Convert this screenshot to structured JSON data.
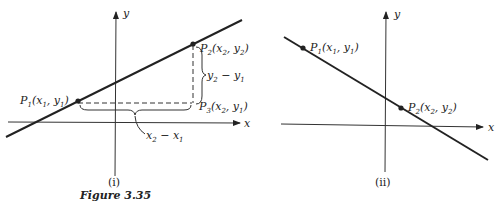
{
  "figure": {
    "caption": "Figure 3.35",
    "panels": [
      {
        "id": "i",
        "label": "(i)",
        "axes": {
          "x_label": "x",
          "y_label": "y"
        },
        "line_slope": "positive",
        "points": [
          {
            "name": "P",
            "sub": "1",
            "coord": "(x",
            "c1": "1",
            "mid": ", y",
            "c2": "1",
            "end": ")"
          },
          {
            "name": "P",
            "sub": "2",
            "coord": "(x",
            "c1": "2",
            "mid": ", y",
            "c2": "2",
            "end": ")"
          },
          {
            "name": "P",
            "sub": "3",
            "coord": "(x",
            "c1": "2",
            "mid": ", y",
            "c2": "1",
            "end": ")"
          }
        ],
        "rise_label": {
          "a": "y",
          "a_sub": "2",
          "op": " − y",
          "b_sub": "1"
        },
        "run_label": {
          "a": "x",
          "a_sub": "2",
          "op": " − x",
          "b_sub": "1"
        }
      },
      {
        "id": "ii",
        "label": "(ii)",
        "axes": {
          "x_label": "x",
          "y_label": "y"
        },
        "line_slope": "negative",
        "points": [
          {
            "name": "P",
            "sub": "1",
            "coord": "(x",
            "c1": "1",
            "mid": ", y",
            "c2": "1",
            "end": ")"
          },
          {
            "name": "P",
            "sub": "2",
            "coord": "(x",
            "c1": "2",
            "mid": ", y",
            "c2": "2",
            "end": ")"
          }
        ]
      }
    ]
  }
}
